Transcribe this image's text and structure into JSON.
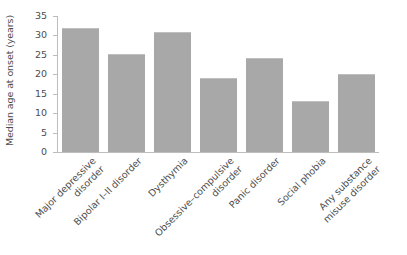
{
  "chart_data": {
    "type": "bar",
    "title": "",
    "xlabel": "",
    "ylabel": "Median age at onset (years)",
    "categories": [
      "Major depressive\ndisorder",
      "Bipolar I–II disorder",
      "Dysthymia",
      "Obsessive–compulsive\ndisorder",
      "Panic disorder",
      "Social phobia",
      "Any substance\nmisuse disorder"
    ],
    "values": [
      32,
      25.1,
      31,
      19.1,
      24.2,
      13.2,
      20.2
    ],
    "ylim": [
      0,
      35
    ],
    "yticks": [
      0,
      5,
      10,
      15,
      20,
      25,
      30,
      35
    ],
    "ytick_labels": [
      "0",
      "5",
      "10",
      "15",
      "20",
      "25",
      "30",
      "35"
    ],
    "grid": false,
    "legend": null,
    "bar_color": "#a8a8a8",
    "axis_color": "#bdbdbd",
    "text_color": "#4d4d4d"
  }
}
